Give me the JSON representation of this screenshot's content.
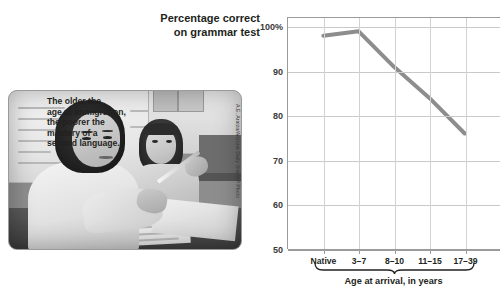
{
  "chart_data": {
    "type": "line",
    "title": "Percentage correct on grammar test",
    "title_lines": [
      "Percentage correct",
      "on grammar test"
    ],
    "xlabel": "Age at arrival, in years",
    "ylabel": "",
    "categories": [
      "Native",
      "3–7",
      "8–10",
      "11–15",
      "17–39"
    ],
    "values": [
      98,
      99,
      91,
      84,
      76
    ],
    "ylim": [
      50,
      102
    ],
    "yticks": [
      100,
      90,
      80,
      70,
      60,
      50
    ],
    "ytick_labels": [
      "100%",
      "90",
      "80",
      "70",
      "60",
      "50"
    ],
    "grid": "both",
    "legend": "none",
    "line_color": "#8d8d8d",
    "annotations": [
      {
        "text": "The older the age at immigration, the poorer the mastery of a second language.",
        "lines": [
          "The older the",
          "age at immigration,",
          "the poorer the",
          "mastery of a",
          "second language."
        ]
      }
    ],
    "bracket": {
      "label": "Age at arrival, in years",
      "spans": [
        "3–7",
        "17–39"
      ]
    }
  },
  "photo": {
    "credit": "A.E. Araiza/Arizona Daily Star/AP Photo",
    "alt": "Black and white photo of a woman and a girl seated at a classroom desk with a whiteboard behind them"
  },
  "colors": {
    "line": "#8d8d8d",
    "axis": "#9b9b9b",
    "grid": "#c9c9c9",
    "text": "#231f20",
    "background": "#ffffff"
  }
}
